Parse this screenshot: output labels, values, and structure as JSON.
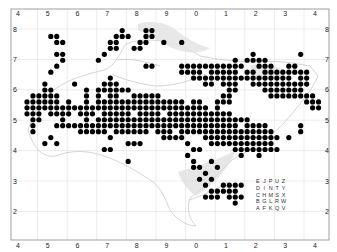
{
  "map": {
    "type": "distribution-map",
    "grid": {
      "x_labels": [
        "4",
        "5",
        "6",
        "7",
        "8",
        "9",
        "0",
        "1",
        "2",
        "3",
        "4"
      ],
      "y_labels": [
        "8",
        "7",
        "6",
        "5",
        "4",
        "3",
        "2"
      ]
    },
    "tetrad_legend": [
      [
        "E",
        "J",
        "P",
        "U",
        "Z"
      ],
      [
        "D",
        "I",
        "N",
        "T",
        "Y"
      ],
      [
        "C",
        "H",
        "M",
        "S",
        "X"
      ],
      [
        "B",
        "G",
        "L",
        "R",
        "W"
      ],
      [
        "A",
        "F",
        "K",
        "Q",
        "V"
      ]
    ],
    "colors": {
      "dot": "#000000",
      "coast": "#b8b8b8",
      "frame": "#888888",
      "grid": "#d8d8d8",
      "mudflat": "#cfcfcf"
    },
    "records_tetrad_grid": [
      [
        16,
        0
      ],
      [
        20,
        0
      ],
      [
        21,
        0
      ],
      [
        4,
        1
      ],
      [
        5,
        1
      ],
      [
        15,
        1
      ],
      [
        16,
        1
      ],
      [
        17,
        1
      ],
      [
        20,
        1
      ],
      [
        21,
        1
      ],
      [
        5,
        2
      ],
      [
        6,
        2
      ],
      [
        14,
        2
      ],
      [
        15,
        2
      ],
      [
        19,
        2
      ],
      [
        20,
        2
      ],
      [
        23,
        2
      ],
      [
        26,
        2
      ],
      [
        14,
        3
      ],
      [
        15,
        3
      ],
      [
        18,
        3
      ],
      [
        19,
        3
      ],
      [
        5,
        4
      ],
      [
        6,
        4
      ],
      [
        13,
        4
      ],
      [
        38,
        4
      ],
      [
        46,
        4
      ],
      [
        6,
        5
      ],
      [
        12,
        5
      ],
      [
        35,
        5
      ],
      [
        37,
        5
      ],
      [
        38,
        5
      ],
      [
        39,
        5
      ],
      [
        40,
        5
      ],
      [
        5,
        6
      ],
      [
        20,
        6
      ],
      [
        21,
        6
      ],
      [
        26,
        6
      ],
      [
        27,
        6
      ],
      [
        28,
        6
      ],
      [
        29,
        6
      ],
      [
        30,
        6
      ],
      [
        31,
        6
      ],
      [
        32,
        6
      ],
      [
        33,
        6
      ],
      [
        34,
        6
      ],
      [
        35,
        6
      ],
      [
        36,
        6
      ],
      [
        39,
        6
      ],
      [
        40,
        6
      ],
      [
        41,
        6
      ],
      [
        44,
        6
      ],
      [
        45,
        6
      ],
      [
        4,
        7
      ],
      [
        26,
        7
      ],
      [
        27,
        7
      ],
      [
        28,
        7
      ],
      [
        29,
        7
      ],
      [
        31,
        7
      ],
      [
        32,
        7
      ],
      [
        33,
        7
      ],
      [
        34,
        7
      ],
      [
        35,
        7
      ],
      [
        37,
        7
      ],
      [
        38,
        7
      ],
      [
        40,
        7
      ],
      [
        41,
        7
      ],
      [
        42,
        7
      ],
      [
        43,
        7
      ],
      [
        44,
        7
      ],
      [
        45,
        7
      ],
      [
        46,
        7
      ],
      [
        47,
        7
      ],
      [
        14,
        8
      ],
      [
        28,
        8
      ],
      [
        29,
        8
      ],
      [
        30,
        8
      ],
      [
        31,
        8
      ],
      [
        32,
        8
      ],
      [
        33,
        8
      ],
      [
        34,
        8
      ],
      [
        35,
        8
      ],
      [
        36,
        8
      ],
      [
        37,
        8
      ],
      [
        38,
        8
      ],
      [
        39,
        8
      ],
      [
        40,
        8
      ],
      [
        41,
        8
      ],
      [
        42,
        8
      ],
      [
        43,
        8
      ],
      [
        44,
        8
      ],
      [
        46,
        8
      ],
      [
        47,
        8
      ],
      [
        3,
        9
      ],
      [
        8,
        9
      ],
      [
        13,
        9
      ],
      [
        14,
        9
      ],
      [
        15,
        9
      ],
      [
        30,
        9
      ],
      [
        31,
        9
      ],
      [
        33,
        9
      ],
      [
        34,
        9
      ],
      [
        35,
        9
      ],
      [
        38,
        9
      ],
      [
        39,
        9
      ],
      [
        40,
        9
      ],
      [
        41,
        9
      ],
      [
        42,
        9
      ],
      [
        43,
        9
      ],
      [
        44,
        9
      ],
      [
        45,
        9
      ],
      [
        46,
        9
      ],
      [
        47,
        9
      ],
      [
        3,
        10
      ],
      [
        4,
        10
      ],
      [
        10,
        10
      ],
      [
        12,
        10
      ],
      [
        13,
        10
      ],
      [
        14,
        10
      ],
      [
        15,
        10
      ],
      [
        16,
        10
      ],
      [
        17,
        10
      ],
      [
        34,
        10
      ],
      [
        35,
        10
      ],
      [
        40,
        10
      ],
      [
        41,
        10
      ],
      [
        42,
        10
      ],
      [
        43,
        10
      ],
      [
        44,
        10
      ],
      [
        45,
        10
      ],
      [
        46,
        10
      ],
      [
        1,
        11
      ],
      [
        2,
        11
      ],
      [
        3,
        11
      ],
      [
        4,
        11
      ],
      [
        5,
        11
      ],
      [
        10,
        11
      ],
      [
        12,
        11
      ],
      [
        14,
        11
      ],
      [
        15,
        11
      ],
      [
        18,
        11
      ],
      [
        19,
        11
      ],
      [
        20,
        11
      ],
      [
        21,
        11
      ],
      [
        22,
        11
      ],
      [
        33,
        11
      ],
      [
        34,
        11
      ],
      [
        41,
        11
      ],
      [
        42,
        11
      ],
      [
        43,
        11
      ],
      [
        44,
        11
      ],
      [
        45,
        11
      ],
      [
        46,
        11
      ],
      [
        47,
        11
      ],
      [
        48,
        11
      ],
      [
        0,
        12
      ],
      [
        1,
        12
      ],
      [
        2,
        12
      ],
      [
        3,
        12
      ],
      [
        4,
        12
      ],
      [
        5,
        12
      ],
      [
        7,
        12
      ],
      [
        10,
        12
      ],
      [
        12,
        12
      ],
      [
        13,
        12
      ],
      [
        14,
        12
      ],
      [
        15,
        12
      ],
      [
        16,
        12
      ],
      [
        17,
        12
      ],
      [
        18,
        12
      ],
      [
        19,
        12
      ],
      [
        20,
        12
      ],
      [
        21,
        12
      ],
      [
        22,
        12
      ],
      [
        23,
        12
      ],
      [
        24,
        12
      ],
      [
        25,
        12
      ],
      [
        26,
        12
      ],
      [
        28,
        12
      ],
      [
        29,
        12
      ],
      [
        32,
        12
      ],
      [
        33,
        12
      ],
      [
        34,
        12
      ],
      [
        47,
        12
      ],
      [
        48,
        12
      ],
      [
        49,
        12
      ],
      [
        0,
        13
      ],
      [
        1,
        13
      ],
      [
        2,
        13
      ],
      [
        3,
        13
      ],
      [
        4,
        13
      ],
      [
        5,
        13
      ],
      [
        6,
        13
      ],
      [
        7,
        13
      ],
      [
        8,
        13
      ],
      [
        9,
        13
      ],
      [
        10,
        13
      ],
      [
        11,
        13
      ],
      [
        12,
        13
      ],
      [
        13,
        13
      ],
      [
        14,
        13
      ],
      [
        15,
        13
      ],
      [
        16,
        13
      ],
      [
        17,
        13
      ],
      [
        18,
        13
      ],
      [
        19,
        13
      ],
      [
        20,
        13
      ],
      [
        21,
        13
      ],
      [
        22,
        13
      ],
      [
        23,
        13
      ],
      [
        24,
        13
      ],
      [
        25,
        13
      ],
      [
        26,
        13
      ],
      [
        27,
        13
      ],
      [
        28,
        13
      ],
      [
        29,
        13
      ],
      [
        30,
        13
      ],
      [
        32,
        13
      ],
      [
        48,
        13
      ],
      [
        49,
        13
      ],
      [
        0,
        14
      ],
      [
        1,
        14
      ],
      [
        2,
        14
      ],
      [
        4,
        14
      ],
      [
        5,
        14
      ],
      [
        6,
        14
      ],
      [
        7,
        14
      ],
      [
        9,
        14
      ],
      [
        10,
        14
      ],
      [
        11,
        14
      ],
      [
        13,
        14
      ],
      [
        14,
        14
      ],
      [
        15,
        14
      ],
      [
        16,
        14
      ],
      [
        17,
        14
      ],
      [
        19,
        14
      ],
      [
        20,
        14
      ],
      [
        21,
        14
      ],
      [
        22,
        14
      ],
      [
        24,
        14
      ],
      [
        25,
        14
      ],
      [
        26,
        14
      ],
      [
        27,
        14
      ],
      [
        28,
        14
      ],
      [
        29,
        14
      ],
      [
        30,
        14
      ],
      [
        31,
        14
      ],
      [
        32,
        14
      ],
      [
        33,
        14
      ],
      [
        34,
        14
      ],
      [
        1,
        15
      ],
      [
        2,
        15
      ],
      [
        6,
        15
      ],
      [
        10,
        15
      ],
      [
        12,
        15
      ],
      [
        13,
        15
      ],
      [
        14,
        15
      ],
      [
        15,
        15
      ],
      [
        16,
        15
      ],
      [
        17,
        15
      ],
      [
        18,
        15
      ],
      [
        19,
        15
      ],
      [
        20,
        15
      ],
      [
        21,
        15
      ],
      [
        22,
        15
      ],
      [
        23,
        15
      ],
      [
        24,
        15
      ],
      [
        25,
        15
      ],
      [
        26,
        15
      ],
      [
        27,
        15
      ],
      [
        28,
        15
      ],
      [
        29,
        15
      ],
      [
        30,
        15
      ],
      [
        31,
        15
      ],
      [
        32,
        15
      ],
      [
        33,
        15
      ],
      [
        34,
        15
      ],
      [
        35,
        15
      ],
      [
        36,
        15
      ],
      [
        37,
        15
      ],
      [
        1,
        16
      ],
      [
        5,
        16
      ],
      [
        6,
        16
      ],
      [
        7,
        16
      ],
      [
        8,
        16
      ],
      [
        9,
        16
      ],
      [
        10,
        16
      ],
      [
        11,
        16
      ],
      [
        12,
        16
      ],
      [
        13,
        16
      ],
      [
        14,
        16
      ],
      [
        15,
        16
      ],
      [
        16,
        16
      ],
      [
        17,
        16
      ],
      [
        18,
        16
      ],
      [
        19,
        16
      ],
      [
        20,
        16
      ],
      [
        21,
        16
      ],
      [
        22,
        16
      ],
      [
        23,
        16
      ],
      [
        24,
        16
      ],
      [
        25,
        16
      ],
      [
        26,
        16
      ],
      [
        27,
        16
      ],
      [
        28,
        16
      ],
      [
        29,
        16
      ],
      [
        30,
        16
      ],
      [
        31,
        16
      ],
      [
        32,
        16
      ],
      [
        33,
        16
      ],
      [
        34,
        16
      ],
      [
        35,
        16
      ],
      [
        37,
        16
      ],
      [
        38,
        16
      ],
      [
        39,
        16
      ],
      [
        40,
        16
      ],
      [
        46,
        16
      ],
      [
        1,
        17
      ],
      [
        9,
        17
      ],
      [
        10,
        17
      ],
      [
        11,
        17
      ],
      [
        12,
        17
      ],
      [
        13,
        17
      ],
      [
        15,
        17
      ],
      [
        16,
        17
      ],
      [
        17,
        17
      ],
      [
        18,
        17
      ],
      [
        19,
        17
      ],
      [
        20,
        17
      ],
      [
        22,
        17
      ],
      [
        23,
        17
      ],
      [
        24,
        17
      ],
      [
        26,
        17
      ],
      [
        27,
        17
      ],
      [
        28,
        17
      ],
      [
        29,
        17
      ],
      [
        30,
        17
      ],
      [
        31,
        17
      ],
      [
        32,
        17
      ],
      [
        33,
        17
      ],
      [
        34,
        17
      ],
      [
        35,
        17
      ],
      [
        36,
        17
      ],
      [
        37,
        17
      ],
      [
        38,
        17
      ],
      [
        39,
        17
      ],
      [
        40,
        17
      ],
      [
        41,
        17
      ],
      [
        46,
        17
      ],
      [
        4,
        18
      ],
      [
        14,
        18
      ],
      [
        23,
        18
      ],
      [
        24,
        18
      ],
      [
        25,
        18
      ],
      [
        26,
        18
      ],
      [
        30,
        18
      ],
      [
        31,
        18
      ],
      [
        32,
        18
      ],
      [
        33,
        18
      ],
      [
        34,
        18
      ],
      [
        35,
        18
      ],
      [
        36,
        18
      ],
      [
        37,
        18
      ],
      [
        38,
        18
      ],
      [
        39,
        18
      ],
      [
        40,
        18
      ],
      [
        41,
        18
      ],
      [
        42,
        18
      ],
      [
        44,
        18
      ],
      [
        3,
        19
      ],
      [
        5,
        19
      ],
      [
        17,
        19
      ],
      [
        18,
        19
      ],
      [
        19,
        19
      ],
      [
        27,
        19
      ],
      [
        31,
        19
      ],
      [
        32,
        19
      ],
      [
        33,
        19
      ],
      [
        34,
        19
      ],
      [
        35,
        19
      ],
      [
        36,
        19
      ],
      [
        37,
        19
      ],
      [
        38,
        19
      ],
      [
        39,
        19
      ],
      [
        40,
        19
      ],
      [
        41,
        19
      ],
      [
        13,
        20
      ],
      [
        14,
        20
      ],
      [
        28,
        20
      ],
      [
        29,
        20
      ],
      [
        35,
        20
      ],
      [
        36,
        20
      ],
      [
        37,
        20
      ],
      [
        38,
        20
      ],
      [
        39,
        20
      ],
      [
        40,
        20
      ],
      [
        41,
        20
      ],
      [
        42,
        20
      ],
      [
        27,
        21
      ],
      [
        36,
        21
      ],
      [
        39,
        21
      ],
      [
        17,
        22
      ],
      [
        28,
        22
      ],
      [
        31,
        22
      ],
      [
        28,
        23
      ],
      [
        29,
        23
      ],
      [
        32,
        23
      ],
      [
        30,
        24
      ],
      [
        29,
        25
      ],
      [
        31,
        25
      ],
      [
        30,
        26
      ],
      [
        33,
        26
      ],
      [
        34,
        26
      ],
      [
        35,
        26
      ],
      [
        36,
        26
      ],
      [
        31,
        27
      ],
      [
        32,
        27
      ],
      [
        33,
        27
      ],
      [
        34,
        27
      ],
      [
        35,
        27
      ],
      [
        30,
        28
      ],
      [
        31,
        28
      ],
      [
        32,
        28
      ],
      [
        34,
        28
      ],
      [
        35,
        28
      ],
      [
        36,
        28
      ],
      [
        35,
        29
      ]
    ]
  }
}
